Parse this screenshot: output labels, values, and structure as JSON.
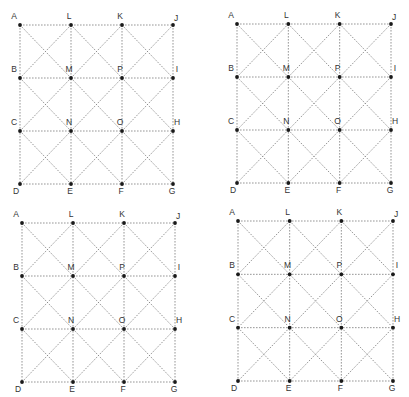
{
  "figure": {
    "type": "labeled-point-grid",
    "panel_count": 4,
    "grid": {
      "rows": 4,
      "cols": 4,
      "labels": [
        [
          "A",
          "L",
          "K",
          "J"
        ],
        [
          "B",
          "M",
          "P",
          "I"
        ],
        [
          "C",
          "N",
          "O",
          "H"
        ],
        [
          "D",
          "E",
          "F",
          "G"
        ]
      ],
      "cell_diagonals": "both"
    },
    "colors": {
      "line": "#8a8a8a",
      "dot": "#1a1a1a",
      "label": "#333333",
      "background": "#ffffff"
    },
    "panels": [
      {
        "name": "panel-top-left",
        "origin": [
          20,
          25
        ],
        "size": [
          153,
          159
        ]
      },
      {
        "name": "panel-top-right",
        "origin": [
          237,
          24
        ],
        "size": [
          154,
          159
        ]
      },
      {
        "name": "panel-bottom-left",
        "origin": [
          22,
          223
        ],
        "size": [
          153,
          159
        ]
      },
      {
        "name": "panel-bottom-right",
        "origin": [
          238,
          221
        ],
        "size": [
          155,
          160
        ]
      }
    ]
  }
}
